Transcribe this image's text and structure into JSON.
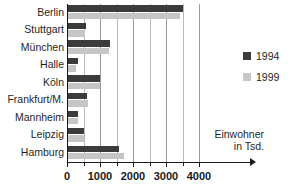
{
  "title_remnant": "Einwohnerzahlen ausgewählter Städte",
  "legend": {
    "position": "right",
    "items": [
      {
        "label": "1994",
        "color": "#3b3b3b",
        "swatch_name": "legend-swatch-1994"
      },
      {
        "label": "1999",
        "color": "#c6c6c6",
        "swatch_name": "legend-swatch-1999"
      }
    ]
  },
  "axis_caption": {
    "line1": "Einwohner",
    "line2": "in Tsd."
  },
  "chart_data": {
    "type": "bar",
    "orientation": "horizontal",
    "title": "",
    "xlabel": "Einwohner in Tsd.",
    "ylabel": "",
    "xlim": [
      0,
      4250
    ],
    "xticks": [
      0,
      1000,
      2000,
      3000,
      4000
    ],
    "xtick_labels": [
      "0",
      "1000",
      "2000",
      "3000",
      "4000"
    ],
    "minor_xticks": [
      500,
      1500,
      2500,
      3500
    ],
    "grid": "vertical-gridlines-every-500",
    "gridlines": [
      500,
      1000,
      1500,
      2000,
      2500,
      3000,
      3500,
      4000
    ],
    "legend_position": "right",
    "categories": [
      "Berlin",
      "Stuttgart",
      "München",
      "Halle",
      "Köln",
      "Frankfurt/M.",
      "Mannheim",
      "Leipzig",
      "Hamburg"
    ],
    "series": [
      {
        "name": "1994",
        "color": "#3b3b3b",
        "values": [
          3475,
          540,
          1280,
          300,
          960,
          580,
          315,
          490,
          1540
        ]
      },
      {
        "name": "1999",
        "color": "#c6c6c6",
        "values": [
          3390,
          525,
          1230,
          255,
          970,
          620,
          305,
          480,
          1710
        ]
      }
    ]
  }
}
